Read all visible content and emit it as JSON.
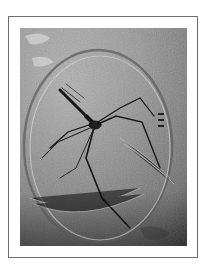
{
  "figure": {
    "colors": {
      "frame_border": "#6e6e6e",
      "background": "#ffffff",
      "photo_light": "#b8b8b8",
      "photo_dark": "#4c4c4c"
    }
  }
}
